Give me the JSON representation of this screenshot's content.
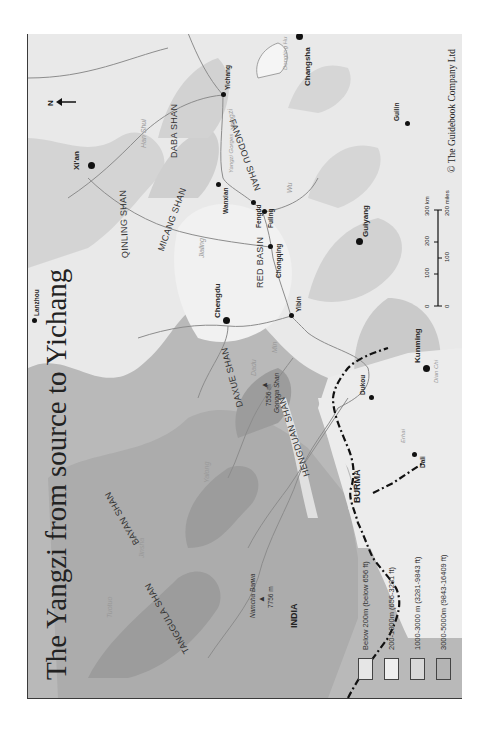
{
  "map": {
    "title": "The Yangzi from source to Yichang",
    "copyright": "© The Guidebook Company Ltd",
    "north_label": "N",
    "cities": [
      {
        "name": "Xi'an",
        "big": true
      },
      {
        "name": "Lanzhou",
        "big": false
      },
      {
        "name": "Chengdu",
        "big": true
      },
      {
        "name": "Chongqing",
        "big": false
      },
      {
        "name": "Yibin",
        "big": false
      },
      {
        "name": "Wanxian",
        "big": false
      },
      {
        "name": "Fengdu",
        "big": false
      },
      {
        "name": "Fuling",
        "big": false
      },
      {
        "name": "Yichang",
        "big": false
      },
      {
        "name": "Changsha",
        "big": true
      },
      {
        "name": "Guilin",
        "big": false
      },
      {
        "name": "Guiyang",
        "big": true
      },
      {
        "name": "Kunming",
        "big": true
      },
      {
        "name": "Dukou",
        "big": false
      },
      {
        "name": "Dali",
        "big": false
      }
    ],
    "ranges": [
      "QINLING SHAN",
      "DABA SHAN",
      "MICANG SHAN",
      "FANGDOU SHAN",
      "RED BASIN",
      "DAXUE SHAN",
      "BAYAN SHAN",
      "TANGGULA SHAN",
      "HENGDUAN SHAN"
    ],
    "rivers": [
      "Han Shui",
      "Yangzi",
      "Yangzi Gorges",
      "Dongting Hu",
      "Wu",
      "Jialing",
      "Min",
      "Dadu",
      "Yalong",
      "Jinsha",
      "Tuotuo",
      "Dian Chi",
      "Erhai"
    ],
    "peaks": [
      {
        "name": "Gongga Shan",
        "height": "7556 m"
      },
      {
        "name": "Namcha Barwa",
        "height": "7756 m"
      }
    ],
    "countries": [
      "INDIA",
      "BURMA"
    ],
    "scale": {
      "km_label": "300 km",
      "miles_label": "200 miles",
      "km_ticks": [
        "0",
        "100",
        "200",
        "300 km"
      ],
      "mile_ticks": [
        "0",
        "100",
        "200 miles"
      ]
    },
    "legend": [
      {
        "label": "Below 200m (below 656 ft)",
        "color": "#e6e6e6"
      },
      {
        "label": "200-1000m (656-3281 ft)",
        "color": "#ededed"
      },
      {
        "label": "1000-3000 m (3281-9843 ft)",
        "color": "#d9d9d9"
      },
      {
        "label": "3000-5000m (9843-16409 ft)",
        "color": "#b4b4b4"
      },
      {
        "label": "Over 5000m (over 16409 ft)",
        "color": "#a2a2a2"
      }
    ],
    "colors": {
      "lowland": "#ececec",
      "hills": "#d6d6d6",
      "mountains": "#b8b8b8",
      "high": "#a5a5a5",
      "river": "#8c8c8c",
      "border": "#111111"
    }
  }
}
